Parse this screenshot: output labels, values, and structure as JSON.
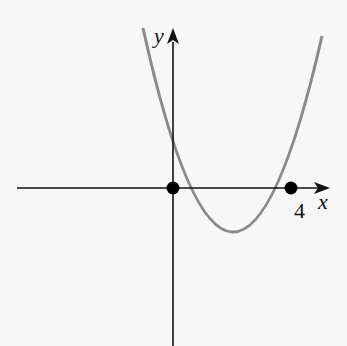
{
  "figure": {
    "type": "function-graph",
    "axes": {
      "x_label": "x",
      "y_label": "y",
      "x_tick_label": "4"
    },
    "curve": {
      "kind": "parabola",
      "roots": [
        0,
        4
      ],
      "color": "#8a8a8a"
    },
    "points": [
      {
        "name": "origin",
        "x": 0,
        "y": 0
      },
      {
        "name": "root-4",
        "x": 4,
        "y": 0
      }
    ],
    "colors": {
      "axis": "#111111",
      "curve": "#8a8a8a",
      "point": "#000000",
      "background": "#f7f7f7"
    }
  }
}
